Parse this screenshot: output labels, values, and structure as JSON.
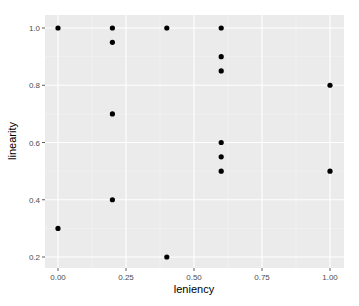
{
  "chart_data": {
    "type": "scatter",
    "title": "",
    "xlabel": "leniency",
    "ylabel": "linearity",
    "xlim": [
      -0.05,
      1.05
    ],
    "ylim": [
      0.16,
      1.04
    ],
    "x_ticks": [
      0.0,
      0.25,
      0.5,
      0.75,
      1.0
    ],
    "x_tick_labels": [
      "0.00",
      "0.25",
      "0.50",
      "0.75",
      "1.00"
    ],
    "y_ticks": [
      0.2,
      0.4,
      0.6,
      0.8,
      1.0
    ],
    "y_tick_labels": [
      "0.2",
      "0.4",
      "0.6",
      "0.8",
      "1.0"
    ],
    "grid": true,
    "legend": "none",
    "points": [
      {
        "x": 0.0,
        "y": 1.0
      },
      {
        "x": 0.2,
        "y": 1.0
      },
      {
        "x": 0.4,
        "y": 1.0
      },
      {
        "x": 0.6,
        "y": 1.0
      },
      {
        "x": 0.2,
        "y": 0.95
      },
      {
        "x": 0.6,
        "y": 0.9
      },
      {
        "x": 0.6,
        "y": 0.85
      },
      {
        "x": 1.0,
        "y": 0.8
      },
      {
        "x": 0.2,
        "y": 0.7
      },
      {
        "x": 0.6,
        "y": 0.6
      },
      {
        "x": 0.6,
        "y": 0.55
      },
      {
        "x": 0.6,
        "y": 0.5
      },
      {
        "x": 1.0,
        "y": 0.5
      },
      {
        "x": 0.2,
        "y": 0.4
      },
      {
        "x": 0.0,
        "y": 0.3
      },
      {
        "x": 0.4,
        "y": 0.2
      }
    ]
  },
  "style": {
    "panel_bg": "#ebebeb",
    "grid_major": "#ffffff",
    "grid_minor": "#f5f5f5",
    "point_color": "#000000"
  }
}
